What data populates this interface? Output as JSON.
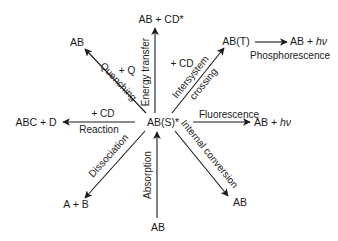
{
  "diagram": {
    "center": {
      "label": "AB(S)*"
    },
    "nodes": {
      "energy_transfer_product": "AB + CD*",
      "quenching_product": "AB",
      "triplet_state": "AB(T)",
      "phosphorescence_product_prefix": "AB + ",
      "phosphorescence_product_hv": "hν",
      "fluorescence_product_prefix": "AB + ",
      "fluorescence_product_hv": "hν",
      "reaction_product": "ABC + D",
      "dissociation_product": "A + B",
      "absorption_source": "AB",
      "internal_conversion_product": "AB"
    },
    "labels": {
      "energy_transfer": "Energy transfer",
      "energy_transfer_reagent": "+ CD",
      "quenching": "Quenching",
      "quenching_reagent": "+ Q",
      "intersystem_line1": "Intersystem",
      "intersystem_line2": "crossing",
      "phosphorescence": "Phosphorescence",
      "fluorescence": "Fluorescence",
      "reaction": "Reaction",
      "reaction_reagent": "+ CD",
      "dissociation": "Dissociation",
      "absorption": "Absorption",
      "internal_conversion": "Internal conversion"
    },
    "colors": {
      "ink": "#1a1a1a",
      "background": "#ffffff"
    }
  }
}
